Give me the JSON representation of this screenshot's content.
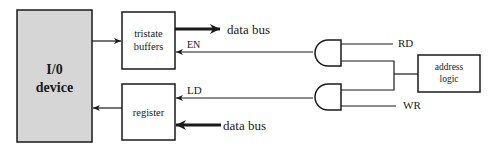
{
  "diagram": {
    "type": "block-diagram",
    "blocks": {
      "io_device": {
        "line1": "I/0",
        "line2": "device",
        "fill": "#d6d6d6"
      },
      "tristate_buffers": {
        "line1": "tristate",
        "line2": "buffers"
      },
      "register": {
        "label": "register"
      },
      "address_logic": {
        "line1": "address",
        "line2": "logic"
      }
    },
    "signals": {
      "en": "EN",
      "ld": "LD",
      "rd": "RD",
      "wr": "WR"
    },
    "buses": {
      "data_bus_out": "data bus",
      "data_bus_in": "data bus"
    },
    "gates": [
      {
        "type": "AND",
        "inputs": [
          "RD",
          "address logic"
        ],
        "output": "EN"
      },
      {
        "type": "AND",
        "inputs": [
          "address logic",
          "WR"
        ],
        "output": "LD"
      }
    ],
    "colors": {
      "line": "#1a1a1a",
      "io_fill": "#d6d6d6",
      "background": "#ffffff"
    }
  }
}
